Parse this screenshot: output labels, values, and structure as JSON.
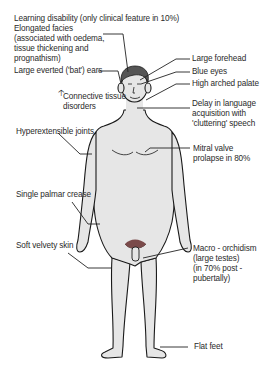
{
  "diagram": {
    "colors": {
      "skin": "#e6e6e6",
      "outline": "#1a1a1a",
      "hair": "#555555",
      "pubic": "#7a4a4a",
      "text": "#2a2a2a"
    },
    "labels_left": [
      {
        "id": "learning",
        "text": "Learning disability (only clinical feature in 10%)"
      },
      {
        "id": "facies",
        "text": "Elongated facies\n(associated with oedema,\ntissue thickening and\nprognathism)"
      },
      {
        "id": "ears",
        "text": "Large everted ('bat') ears"
      },
      {
        "id": "connective",
        "text": "Connective tissue\ndisorders",
        "icon": "up-arrow-icon"
      },
      {
        "id": "joints",
        "text": "Hyperextensible joints"
      },
      {
        "id": "palmar",
        "text": "Single palmar crease"
      },
      {
        "id": "skin",
        "text": "Soft velvety skin"
      }
    ],
    "labels_right": [
      {
        "id": "forehead",
        "text": "Large forehead"
      },
      {
        "id": "eyes",
        "text": "Blue eyes"
      },
      {
        "id": "palate",
        "text": "High arched palate"
      },
      {
        "id": "speech",
        "text": "Delay in language\nacquisition with\n'cluttering' speech"
      },
      {
        "id": "mitral",
        "text": "Mitral valve\nprolapse in 80%"
      },
      {
        "id": "orchidism",
        "text": "Macro - orchidism\n(large testes)\n(in 70% post -\npubertally)"
      },
      {
        "id": "feet",
        "text": "Flat feet"
      }
    ]
  }
}
